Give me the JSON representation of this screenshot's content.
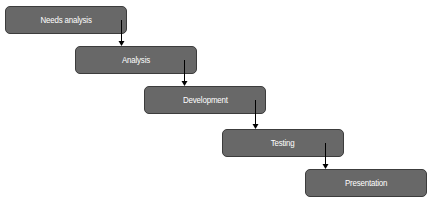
{
  "diagram": {
    "type": "waterfall-flow",
    "colors": {
      "box_fill": "#686868",
      "box_border": "#3c3c3c",
      "label": "#ffffff",
      "arrow": "#000000"
    },
    "steps": [
      {
        "label": "Needs analysis",
        "x": 5,
        "y": 6
      },
      {
        "label": "Analysis",
        "x": 75,
        "y": 46
      },
      {
        "label": "Development",
        "x": 144,
        "y": 86
      },
      {
        "label": "Testing",
        "x": 222,
        "y": 129
      },
      {
        "label": "Presentation",
        "x": 305,
        "y": 169
      }
    ],
    "connectors": [
      {
        "from": "Needs analysis",
        "to": "Analysis",
        "x": 121,
        "y1": 20,
        "y2": 46
      },
      {
        "from": "Analysis",
        "to": "Development",
        "x": 184,
        "y1": 60,
        "y2": 86
      },
      {
        "from": "Development",
        "to": "Testing",
        "x": 255,
        "y1": 100,
        "y2": 129
      },
      {
        "from": "Testing",
        "to": "Presentation",
        "x": 325,
        "y1": 143,
        "y2": 169
      }
    ]
  }
}
